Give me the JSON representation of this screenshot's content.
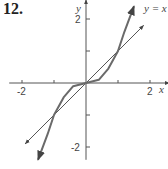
{
  "problem_number": "12.",
  "colors": {
    "axis": "#555555",
    "curve": "#6a6a6a",
    "line": "#555555"
  },
  "chart_data": {
    "type": "line",
    "title": "",
    "xlabel": "x",
    "ylabel": "y",
    "xlim": [
      -2.6,
      2.6
    ],
    "ylim": [
      -2.4,
      2.6
    ],
    "x_ticks": [
      -2,
      -1,
      1,
      2
    ],
    "y_ticks": [
      -2,
      -1,
      1,
      2
    ],
    "x_tick_labels": [
      "-2",
      "2"
    ],
    "y_tick_labels": [
      "2",
      "-2"
    ],
    "series": [
      {
        "name": "y = x",
        "label": "y = x",
        "x": [
          -1.9,
          1.8
        ],
        "y": [
          -1.9,
          1.8
        ]
      },
      {
        "name": "curve",
        "label": "",
        "x": [
          -1.5,
          -1.2,
          -1.0,
          -0.7,
          -0.4,
          0,
          0.4,
          0.7,
          1.0,
          1.2,
          1.5
        ],
        "y": [
          -2.4,
          -1.6,
          -1.0,
          -0.45,
          -0.1,
          0,
          0.1,
          0.45,
          1.0,
          1.6,
          2.4
        ]
      }
    ],
    "annotations": [
      {
        "text": "y = x",
        "x": 1.9,
        "y": 2.25
      }
    ],
    "grid": false,
    "legend": "none"
  }
}
